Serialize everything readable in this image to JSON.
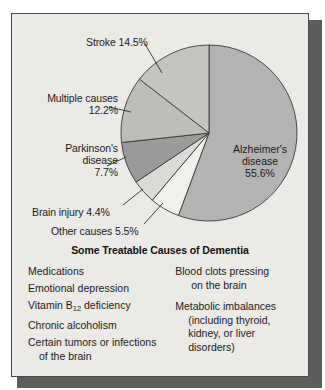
{
  "figure": {
    "panel_bg": "#eceae6",
    "border_color": "#4a4a4a",
    "shadow_color": "#5d5d5d"
  },
  "chart_data": {
    "type": "pie",
    "title": "",
    "categories": [
      "Alzheimer's disease",
      "Other causes",
      "Brain injury",
      "Parkinson's disease",
      "Multiple causes",
      "Stroke"
    ],
    "values": [
      55.6,
      5.5,
      4.4,
      7.7,
      12.2,
      14.5
    ],
    "unit": "%",
    "start_angle_deg": 0,
    "direction": "clockwise",
    "legend": "none",
    "grid": false,
    "colors": [
      "#b3b3b3",
      "#f2f0ec",
      "#dcdad6",
      "#9a9a9a",
      "#bfbdb9",
      "#c6c4c0"
    ],
    "slice_labels": [
      {
        "name": "Alzheimer's disease",
        "text_lines": [
          "Alzheimer's",
          "disease",
          "55.6%"
        ],
        "placement": "inside"
      },
      {
        "name": "Stroke",
        "text_lines": [
          "Stroke  14.5%"
        ],
        "placement": "callout"
      },
      {
        "name": "Multiple causes",
        "text_lines": [
          "Multiple causes",
          "12.2%"
        ],
        "placement": "callout"
      },
      {
        "name": "Parkinson's disease",
        "text_lines": [
          "Parkinson's",
          "disease",
          "7.7%"
        ],
        "placement": "callout"
      },
      {
        "name": "Brain injury",
        "text_lines": [
          "Brain injury  4.4%"
        ],
        "placement": "callout"
      },
      {
        "name": "Other causes",
        "text_lines": [
          "Other causes  5.5%"
        ],
        "placement": "callout"
      }
    ]
  },
  "labels": {
    "stroke": "Stroke  14.5%",
    "multiple_name": "Multiple causes",
    "multiple_value": "12.2%",
    "parkinsons_name": "Parkinson's",
    "parkinsons_name2": "disease",
    "parkinsons_value": "7.7%",
    "brain_injury": "Brain injury  4.4%",
    "other_causes": "Other causes  5.5%",
    "alzheimers_name": "Alzheimer's",
    "alzheimers_name2": "disease",
    "alzheimers_value": "55.6%"
  },
  "table": {
    "title": "Some Treatable Causes of Dementia",
    "left_column": [
      {
        "text": "Medications",
        "cont": ""
      },
      {
        "text": "Emotional depression",
        "cont": ""
      },
      {
        "text": "Vitamin B",
        "sub": "12",
        "text_after": " deficiency",
        "cont": ""
      },
      {
        "text": "Chronic alcoholism",
        "cont": ""
      },
      {
        "text": "Certain tumors or infections",
        "cont": "of the brain"
      }
    ],
    "right_column": [
      {
        "text": "Blood clots pressing",
        "cont": "on the brain"
      },
      {
        "text": "Metabolic imbalances",
        "cont": "(including thyroid,",
        "cont2": "kidney, or liver",
        "cont3": "disorders)"
      }
    ]
  }
}
